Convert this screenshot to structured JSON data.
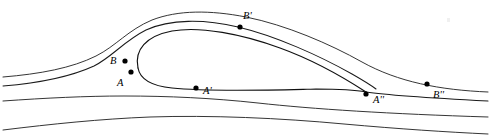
{
  "figure": {
    "width": 491,
    "height": 138,
    "background_color": "#ffffff",
    "line_color": "#1a1a1a",
    "dot_color": "#000000"
  },
  "points": [
    {
      "id": "B",
      "label": "B",
      "dot_x": 125,
      "dot_y": 61,
      "label_x": 110,
      "label_y": 56
    },
    {
      "id": "A",
      "label": "A",
      "dot_x": 131,
      "dot_y": 72,
      "label_x": 117,
      "label_y": 78
    },
    {
      "id": "Bp",
      "label": "B'",
      "dot_x": 240,
      "dot_y": 27,
      "label_x": 243,
      "label_y": 11
    },
    {
      "id": "Ap",
      "label": "A'",
      "dot_x": 196,
      "dot_y": 88,
      "label_x": 203,
      "label_y": 86
    },
    {
      "id": "App",
      "label": "A''",
      "dot_x": 366,
      "dot_y": 94,
      "label_x": 373,
      "label_y": 95
    },
    {
      "id": "Bpp",
      "label": "B''",
      "dot_x": 427,
      "dot_y": 84,
      "label_x": 433,
      "label_y": 90
    }
  ],
  "curves": [
    {
      "id": "outer-upper-streamline",
      "name": "outer-upper-streamline",
      "d": "M 3 77 C 40 74, 72 68, 96 56 C 116 46, 128 30, 152 20 C 178 10, 210 10, 246 17 C 286 25, 330 44, 362 62 C 398 82, 440 90, 488 92"
    },
    {
      "id": "dividing-streamline-upper-branch",
      "name": "dividing-streamline-upper-branch",
      "d": "M 3 86 C 40 83, 70 77, 94 66 C 112 57, 124 41, 146 30 C 170 19, 204 19, 238 27 C 276 36, 320 56, 352 74 C 366 82, 372 86, 376 89"
    },
    {
      "id": "bubble-upper-arc",
      "name": "bubble-upper-arc",
      "d": "M 138 68 C 134 50, 146 36, 172 31 C 200 26, 242 34, 280 48 C 316 61, 346 79, 366 92"
    },
    {
      "id": "bubble-lower-arc",
      "name": "bubble-lower-arc",
      "d": "M 138 68 C 140 79, 152 86, 172 88 C 210 92, 272 90, 316 89 C 340 89, 356 90, 366 92"
    },
    {
      "id": "dividing-streamline-lower-branch",
      "name": "dividing-streamline-lower-branch",
      "d": "M 366 92 C 392 96, 430 98, 488 101"
    },
    {
      "id": "inner-lower-streamline",
      "name": "inner-lower-streamline",
      "d": "M 3 101 C 46 98, 86 96, 124 96 C 168 96, 212 98, 258 103 C 312 109, 390 114, 488 117"
    },
    {
      "id": "outer-lower-streamline",
      "name": "outer-lower-streamline",
      "d": "M 3 130 C 52 124, 100 119, 150 117 C 210 115, 280 118, 344 124 C 400 129, 446 132, 488 134"
    }
  ]
}
